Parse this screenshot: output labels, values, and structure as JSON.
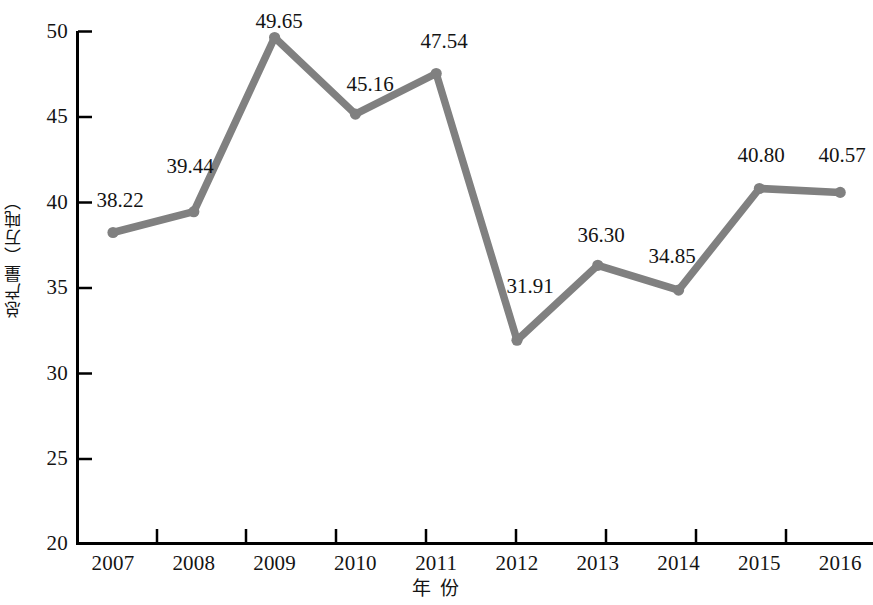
{
  "chart_data": {
    "type": "line",
    "title": "",
    "xlabel": "年  份",
    "ylabel": "总产量（万吨）",
    "categories": [
      "2007",
      "2008",
      "2009",
      "2010",
      "2011",
      "2012",
      "2013",
      "2014",
      "2015",
      "2016"
    ],
    "values": [
      38.22,
      39.44,
      49.65,
      45.16,
      47.54,
      31.91,
      36.3,
      34.85,
      40.8,
      40.57
    ],
    "point_labels": [
      "38.22",
      "39.44",
      "49.65",
      "45.16",
      "47.54",
      "31.91",
      "36.30",
      "34.85",
      "40.80",
      "40.57"
    ],
    "ylim": [
      20,
      50
    ],
    "y_ticks": [
      20,
      25,
      30,
      35,
      40,
      45,
      50
    ],
    "y_tick_labels": [
      "20",
      "25",
      "30",
      "35",
      "40",
      "45",
      "50"
    ],
    "grid": false,
    "legend": "none",
    "series_color": "#808080",
    "axis_color": "#000000",
    "text_color": "#141414",
    "marker": "circle",
    "line_width": 7
  },
  "axes": {
    "y_title": "总产量（万吨）",
    "x_title": "年  份"
  }
}
